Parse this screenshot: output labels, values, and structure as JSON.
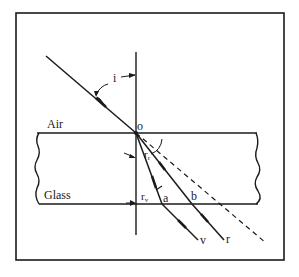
{
  "figure": {
    "media": {
      "upper": "Air",
      "lower": "Glass"
    },
    "labels": {
      "incidence_angle": "i",
      "origin_point": "o",
      "refraction_angle_red": "r",
      "refraction_angle_red_sub": "r",
      "refraction_angle_violet": "r",
      "refraction_angle_violet_sub": "v",
      "exit_point_violet": "a",
      "exit_point_red": "b",
      "ray_violet": "v",
      "ray_red": "r"
    },
    "colors": {
      "ink": "#1a1a1a",
      "background": "#ffffff"
    }
  }
}
